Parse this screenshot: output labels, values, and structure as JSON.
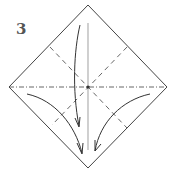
{
  "diagram": {
    "step_number": "3",
    "colors": {
      "paper_edge": "#444444",
      "valley_fold": "#555555",
      "mountain_fold": "#555555",
      "center_crease": "#b0b0b0",
      "arrow": "#333333"
    },
    "elements": [
      {
        "type": "square-paper-diamond",
        "vertices": [
          [
            88,
            5
          ],
          [
            167,
            87
          ],
          [
            88,
            168
          ],
          [
            9,
            87
          ]
        ]
      },
      {
        "type": "mountain-fold-line",
        "orientation": "horizontal",
        "y": 87
      },
      {
        "type": "valley-fold-line",
        "orientation": "diagonal",
        "direction": "top-left-to-center-bottom-right"
      },
      {
        "type": "valley-fold-line",
        "orientation": "diagonal",
        "direction": "top-right-to-center-bottom-left"
      },
      {
        "type": "existing-crease",
        "orientation": "vertical",
        "x": 88
      },
      {
        "type": "arrow",
        "description": "top corner folds down"
      },
      {
        "type": "arrow",
        "description": "left flap folds to bottom"
      },
      {
        "type": "arrow",
        "description": "right flap folds to bottom"
      }
    ]
  }
}
